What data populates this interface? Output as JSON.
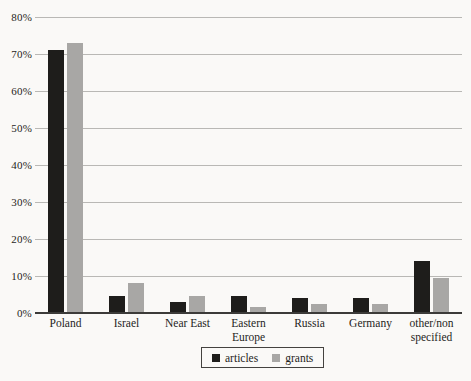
{
  "page": {
    "background": "#faf9f7"
  },
  "chart_data": {
    "type": "bar",
    "title": "",
    "xlabel": "",
    "ylabel": "",
    "categories": [
      "Poland",
      "Israel",
      "Near East",
      "Eastern Europe",
      "Russia",
      "Germany",
      "other/non specified"
    ],
    "category_label_lines": [
      "Poland",
      "Israel",
      "Near East",
      "Eastern\nEurope",
      "Russia",
      "Germany",
      "other/non\nspecified"
    ],
    "series": [
      {
        "name": "articles",
        "color": "#1e1d1b",
        "values": [
          71,
          4.5,
          3,
          4.5,
          4,
          4,
          14
        ]
      },
      {
        "name": "grants",
        "color": "#a8a7a5",
        "values": [
          73,
          8,
          4.5,
          1.5,
          2.5,
          2.5,
          9.5
        ]
      }
    ],
    "ylim": [
      0,
      80
    ],
    "y_ticks": [
      "0%",
      "10%",
      "20%",
      "30%",
      "40%",
      "50%",
      "60%",
      "70%",
      "80%"
    ],
    "grid": true,
    "legend_position": "bottom-center",
    "colors": {
      "gridline": "#b9b8b5",
      "axis": "#3c3b39",
      "text": "#1f1e1c"
    }
  }
}
